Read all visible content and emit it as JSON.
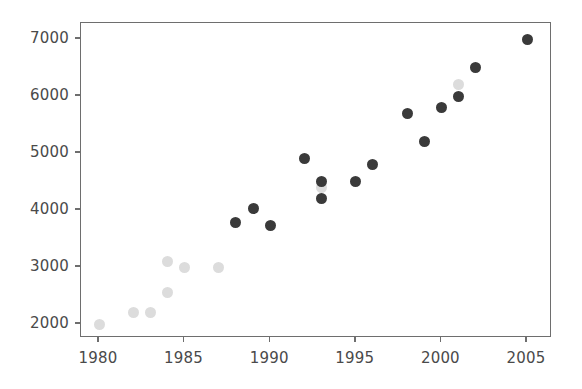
{
  "chart_data": {
    "type": "scatter",
    "title": "",
    "subtitle": "",
    "xlabel": "",
    "ylabel": "",
    "xlim": [
      1978.95,
      1906.5
    ],
    "ylim": [
      1780,
      7320
    ],
    "grid": false,
    "legend": "none",
    "x_ticks": [
      1980,
      1985,
      1990,
      1995,
      2000,
      2005
    ],
    "x_tick_labels": [
      "1980",
      "1985",
      "1990",
      "1995",
      "2000",
      "2005"
    ],
    "y_ticks": [
      2000,
      3000,
      4000,
      5000,
      6000,
      7000
    ],
    "y_tick_labels": [
      "2000",
      "3000",
      "4000",
      "5000",
      "6000",
      "7000"
    ],
    "colors": {
      "dark_marker": "#3a3a3a",
      "light_marker": "#dcdcdc",
      "axis": "#6e6e6e",
      "tick_label": "#4a4a4a",
      "background": "#ffffff"
    },
    "series": [
      {
        "name": "light-series",
        "color": "#dcdcdc",
        "marker": "circle",
        "points": [
          {
            "x": 1980,
            "y": 2000
          },
          {
            "x": 1982,
            "y": 2200
          },
          {
            "x": 1983,
            "y": 2200
          },
          {
            "x": 1984,
            "y": 2550
          },
          {
            "x": 1984,
            "y": 3100
          },
          {
            "x": 1985,
            "y": 3000
          },
          {
            "x": 1987,
            "y": 3000
          },
          {
            "x": 1993,
            "y": 4400
          },
          {
            "x": 2001,
            "y": 6200
          }
        ]
      },
      {
        "name": "dark-series",
        "color": "#3a3a3a",
        "marker": "circle",
        "points": [
          {
            "x": 1988,
            "y": 3780
          },
          {
            "x": 1989,
            "y": 4020
          },
          {
            "x": 1990,
            "y": 3720
          },
          {
            "x": 1992,
            "y": 4900
          },
          {
            "x": 1993,
            "y": 4500
          },
          {
            "x": 1993,
            "y": 4200
          },
          {
            "x": 1995,
            "y": 4500
          },
          {
            "x": 1996,
            "y": 4800
          },
          {
            "x": 1998,
            "y": 5700
          },
          {
            "x": 1999,
            "y": 5200
          },
          {
            "x": 2000,
            "y": 5800
          },
          {
            "x": 2001,
            "y": 6000
          },
          {
            "x": 2002,
            "y": 6500
          },
          {
            "x": 2005,
            "y": 7000
          }
        ]
      }
    ]
  }
}
